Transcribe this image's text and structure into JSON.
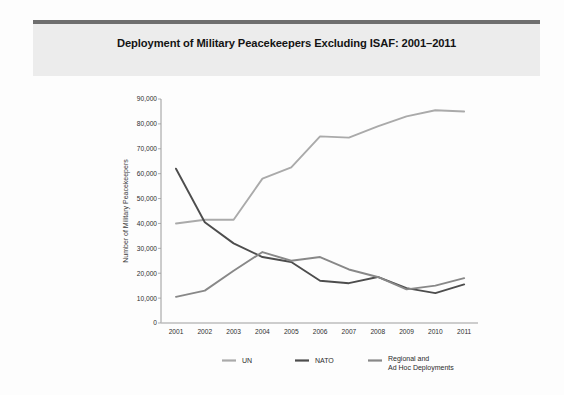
{
  "figure": {
    "background": "#fdfdfd",
    "banner_background": "#ececec",
    "banner_rule_color": "#6e6e6e"
  },
  "chart_data": {
    "type": "line",
    "title": "Deployment of Military Peacekeepers Excluding ISAF: 2001–2011",
    "xlabel": "",
    "ylabel": "Number of Military Peacekeepers",
    "categories": [
      "2001",
      "2002",
      "2003",
      "2004",
      "2005",
      "2006",
      "2007",
      "2008",
      "2009",
      "2010",
      "2011"
    ],
    "ylim": [
      0,
      90000
    ],
    "yticks": [
      "0",
      "10,000",
      "20,000",
      "30,000",
      "40,000",
      "50,000",
      "60,000",
      "70,000",
      "80,000",
      "90,000"
    ],
    "ytick_values": [
      0,
      10000,
      20000,
      30000,
      40000,
      50000,
      60000,
      70000,
      80000,
      90000
    ],
    "grid": false,
    "legend_position": "bottom",
    "series": [
      {
        "name": "UN",
        "color": "#aaaaaa",
        "values": [
          40000,
          41500,
          41500,
          58000,
          62500,
          75000,
          74500,
          79000,
          83000,
          85500,
          85000
        ]
      },
      {
        "name": "NATO",
        "color": "#4d4d4d",
        "values": [
          62000,
          40500,
          32000,
          26500,
          24500,
          17000,
          16000,
          18500,
          14000,
          12000,
          15500
        ]
      },
      {
        "name": "Regional and Ad Hoc Deployments",
        "color": "#888888",
        "values": [
          10500,
          13000,
          21000,
          28500,
          25000,
          26500,
          21500,
          18500,
          13500,
          15000,
          18000
        ]
      }
    ]
  },
  "legend": {
    "items": [
      {
        "label": "UN",
        "color": "#aaaaaa"
      },
      {
        "label": "NATO",
        "color": "#4d4d4d"
      },
      {
        "label_line1": "Regional and",
        "label_line2": "Ad Hoc Deployments",
        "color": "#888888"
      }
    ]
  }
}
